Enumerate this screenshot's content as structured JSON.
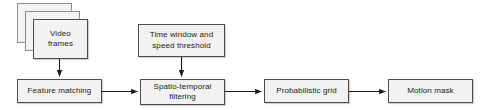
{
  "diagram": {
    "type": "flowchart",
    "canvas": {
      "width": 488,
      "height": 110
    },
    "style": {
      "node_fill": "#f2f2f2",
      "node_border": "#4d4d4d",
      "stack_border": "#8c8c8c",
      "arrow_color": "#1a1a1a",
      "background": "#ffffff",
      "text_color": "#1a1a1a"
    },
    "nodes": [
      {
        "id": "video-frames",
        "label": "Video\nframes",
        "line1": "Video",
        "line2": "frames",
        "shape": "stacked-rectangle",
        "stack_count": 3,
        "x": 33,
        "y": 19,
        "w": 55,
        "h": 40
      },
      {
        "id": "time-window-speed-threshold",
        "label": "Time window and\nspeed threshold",
        "line1": "Time window and",
        "line2": "speed threshold",
        "shape": "rectangle",
        "x": 138,
        "y": 24,
        "w": 87,
        "h": 33
      },
      {
        "id": "feature-matching",
        "label": "Feature matching",
        "line1": "Feature matching",
        "line2": "",
        "shape": "rectangle",
        "x": 17,
        "y": 79,
        "w": 85,
        "h": 24
      },
      {
        "id": "spatio-temporal-filtering",
        "label": "Spatio-temporal\nfiltering",
        "line1": "Spatio-temporal",
        "line2": "filtering",
        "shape": "rectangle",
        "x": 140,
        "y": 79,
        "w": 85,
        "h": 26
      },
      {
        "id": "probabilistic-grid",
        "label": "Probabilistic grid",
        "line1": "Probabilistic grid",
        "line2": "",
        "shape": "rectangle",
        "x": 264,
        "y": 79,
        "w": 85,
        "h": 24
      },
      {
        "id": "motion-mask",
        "label": "Motion mask",
        "line1": "Motion mask",
        "line2": "",
        "shape": "rectangle",
        "x": 388,
        "y": 79,
        "w": 85,
        "h": 24
      }
    ],
    "edges": [
      {
        "id": "video-frames-to-feature-matching",
        "from": "video-frames",
        "to": "feature-matching",
        "direction": "down"
      },
      {
        "id": "feature-matching-to-spatio-temporal-filtering",
        "from": "feature-matching",
        "to": "spatio-temporal-filtering",
        "direction": "right"
      },
      {
        "id": "time-window-to-spatio-temporal-filtering",
        "from": "time-window-speed-threshold",
        "to": "spatio-temporal-filtering",
        "direction": "down"
      },
      {
        "id": "spatio-temporal-filtering-to-probabilistic-grid",
        "from": "spatio-temporal-filtering",
        "to": "probabilistic-grid",
        "direction": "right"
      },
      {
        "id": "probabilistic-grid-to-motion-mask",
        "from": "probabilistic-grid",
        "to": "motion-mask",
        "direction": "right"
      }
    ]
  }
}
